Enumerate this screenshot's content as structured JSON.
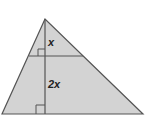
{
  "diagram": {
    "type": "geometry-figure",
    "shape": "triangle",
    "fill_color": "#d3d3d3",
    "stroke_color": "#555555",
    "labels": {
      "upper_segment": "x",
      "lower_segment": "2x"
    },
    "features": [
      "altitude from apex to base",
      "line parallel to base",
      "right-angle marker at parallel line",
      "right-angle marker at base"
    ]
  }
}
